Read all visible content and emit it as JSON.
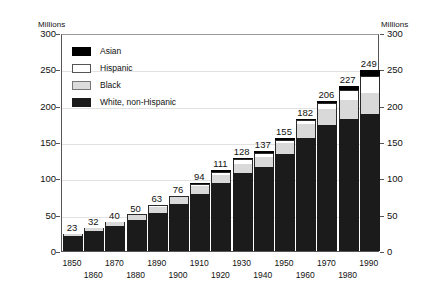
{
  "chart_data": {
    "type": "bar",
    "stacked": true,
    "title": "",
    "subtitle": "",
    "xlabel": "",
    "ylabel": "Millions",
    "ylabel_right": "Millions",
    "ylim": [
      0,
      300
    ],
    "yticks": [
      0,
      50,
      100,
      150,
      200,
      250,
      300
    ],
    "ytick_labels": [
      "0",
      "50",
      "100",
      "150",
      "200",
      "250",
      "300"
    ],
    "grid": true,
    "legend_position": "upper-left-inside",
    "categories": [
      "1850",
      "1860",
      "1870",
      "1880",
      "1890",
      "1900",
      "1910",
      "1920",
      "1930",
      "1940",
      "1950",
      "1960",
      "1970",
      "1980",
      "1990"
    ],
    "series": [
      {
        "name": "White, non-Hispanic",
        "color": "#1b1b1b",
        "values": [
          20,
          28,
          35,
          43,
          53,
          65,
          79,
          94,
          108,
          116,
          134,
          156,
          173,
          181,
          188
        ]
      },
      {
        "name": "Black",
        "color": "#d9d9d9",
        "values": [
          3,
          4,
          5,
          6,
          8,
          9,
          10,
          11,
          12,
          13,
          15,
          19,
          23,
          27,
          30
        ]
      },
      {
        "name": "Hispanic",
        "color": "#ffffff",
        "values": [
          0,
          0,
          0,
          1,
          2,
          2,
          3,
          4,
          6,
          6,
          4,
          5,
          8,
          14,
          23
        ]
      },
      {
        "name": "Asian",
        "color": "#000000",
        "values": [
          0,
          0,
          0,
          0,
          0,
          0,
          2,
          2,
          2,
          2,
          2,
          2,
          2,
          5,
          8
        ]
      }
    ],
    "totals": [
      23,
      32,
      40,
      50,
      63,
      76,
      94,
      111,
      128,
      137,
      155,
      182,
      206,
      227,
      249
    ],
    "total_labels": [
      "23",
      "32",
      "40",
      "50",
      "63",
      "76",
      "94",
      "111",
      "128",
      "137",
      "155",
      "182",
      "206",
      "227",
      "249"
    ],
    "xtick_rows": {
      "top": [
        "1850",
        "1870",
        "1890",
        "1910",
        "1930",
        "1950",
        "1970",
        "1990"
      ],
      "bottom": [
        "1860",
        "1880",
        "1900",
        "1920",
        "1940",
        "1960",
        "1980"
      ]
    }
  },
  "legend": {
    "items": [
      {
        "label": "Asian",
        "swatch": "asian-swatch"
      },
      {
        "label": "Hispanic",
        "swatch": "hispanic-swatch"
      },
      {
        "label": "Black",
        "swatch": "black-swatch"
      },
      {
        "label": "White, non-Hispanic",
        "swatch": "white-non-hispanic-swatch"
      }
    ]
  }
}
